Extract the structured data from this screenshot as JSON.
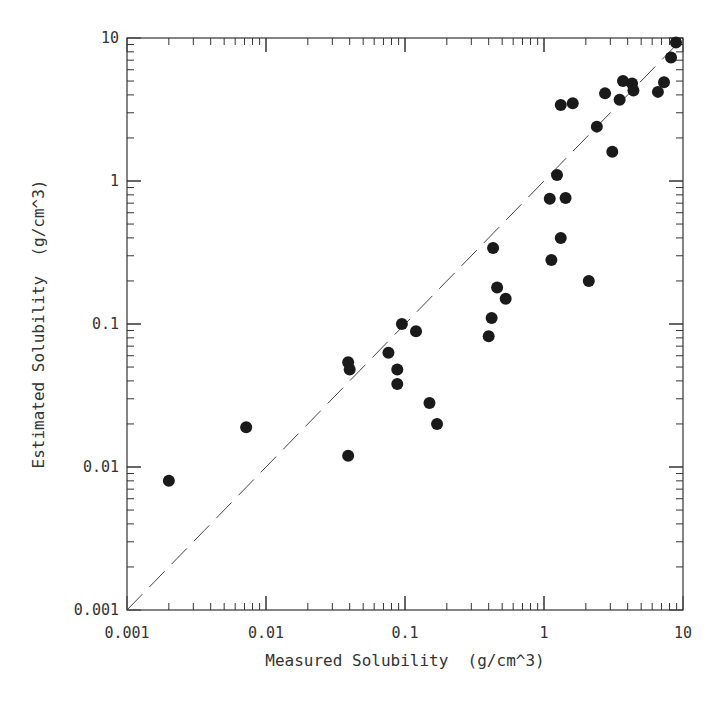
{
  "chart_data": {
    "type": "scatter",
    "title": "",
    "xlabel": "Measured Solubility  (g/cm^3)",
    "ylabel": "Estimated Solubility  (g/cm^3)",
    "xscale": "log",
    "yscale": "log",
    "xlim": [
      0.001,
      10
    ],
    "ylim": [
      0.001,
      10
    ],
    "x_tick_labels": [
      "0.001",
      "0.01",
      "0.1",
      "1",
      "10"
    ],
    "y_tick_labels": [
      "0.001",
      "0.01",
      "0.1",
      "1",
      "10"
    ],
    "x_ticks": [
      0.001,
      0.01,
      0.1,
      1,
      10
    ],
    "y_ticks": [
      0.001,
      0.01,
      0.1,
      1,
      10
    ],
    "grid": false,
    "legend": null,
    "reference_line": {
      "type": "dashed",
      "description": "y = x",
      "from": [
        0.001,
        0.001
      ],
      "to": [
        10,
        10
      ]
    },
    "series": [
      {
        "name": "compounds",
        "marker": "filled-circle",
        "color": "#1a1a1a",
        "points": [
          {
            "x": 0.002,
            "y": 0.008
          },
          {
            "x": 0.0072,
            "y": 0.019
          },
          {
            "x": 0.039,
            "y": 0.012
          },
          {
            "x": 0.039,
            "y": 0.054
          },
          {
            "x": 0.04,
            "y": 0.048
          },
          {
            "x": 0.076,
            "y": 0.063
          },
          {
            "x": 0.088,
            "y": 0.048
          },
          {
            "x": 0.088,
            "y": 0.038
          },
          {
            "x": 0.095,
            "y": 0.1
          },
          {
            "x": 0.12,
            "y": 0.089
          },
          {
            "x": 0.15,
            "y": 0.028
          },
          {
            "x": 0.17,
            "y": 0.02
          },
          {
            "x": 0.4,
            "y": 0.082
          },
          {
            "x": 0.42,
            "y": 0.11
          },
          {
            "x": 0.43,
            "y": 0.34
          },
          {
            "x": 0.46,
            "y": 0.18
          },
          {
            "x": 0.53,
            "y": 0.15
          },
          {
            "x": 1.1,
            "y": 0.75
          },
          {
            "x": 1.13,
            "y": 0.28
          },
          {
            "x": 1.24,
            "y": 1.1
          },
          {
            "x": 1.32,
            "y": 0.4
          },
          {
            "x": 1.32,
            "y": 3.4
          },
          {
            "x": 1.43,
            "y": 0.76
          },
          {
            "x": 1.61,
            "y": 3.5
          },
          {
            "x": 2.1,
            "y": 0.2
          },
          {
            "x": 2.4,
            "y": 2.4
          },
          {
            "x": 2.75,
            "y": 4.1
          },
          {
            "x": 3.1,
            "y": 1.6
          },
          {
            "x": 3.5,
            "y": 3.7
          },
          {
            "x": 3.7,
            "y": 5.0
          },
          {
            "x": 4.3,
            "y": 4.8
          },
          {
            "x": 4.4,
            "y": 4.3
          },
          {
            "x": 6.6,
            "y": 4.2
          },
          {
            "x": 7.3,
            "y": 4.9
          },
          {
            "x": 8.2,
            "y": 7.3
          },
          {
            "x": 8.9,
            "y": 9.3
          }
        ]
      }
    ]
  },
  "colors": {
    "background": "#ffffff",
    "axis": "#333333",
    "marker": "#1a1a1a",
    "reference_line": "#444444"
  }
}
